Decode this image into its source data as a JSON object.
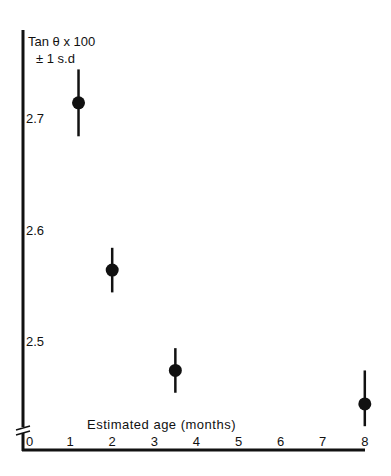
{
  "chart_data": {
    "type": "scatter",
    "title": "",
    "ylabel": "Tan θ x 100",
    "ylabel_sub": "± 1 s.d",
    "xlabel": "Estimated age (months)",
    "x_ticks": [
      "0",
      "1",
      "2",
      "3",
      "4",
      "5",
      "6",
      "7",
      "8"
    ],
    "y_ticks": [
      "2.5",
      "2.6",
      "2.7"
    ],
    "xlim": [
      0,
      8
    ],
    "ylim": [
      2.42,
      2.77
    ],
    "grid": false,
    "legend": null,
    "axis_break": "y-axis broken near origin",
    "series": [
      {
        "name": "Tan θ x 100",
        "points": [
          {
            "x": 1.2,
            "y": 2.71,
            "err_low": 2.68,
            "err_high": 2.74
          },
          {
            "x": 2.0,
            "y": 2.56,
            "err_low": 2.54,
            "err_high": 2.58
          },
          {
            "x": 3.5,
            "y": 2.47,
            "err_low": 2.45,
            "err_high": 2.49
          },
          {
            "x": 8.0,
            "y": 2.44,
            "err_low": 2.42,
            "err_high": 2.47
          }
        ]
      }
    ]
  }
}
